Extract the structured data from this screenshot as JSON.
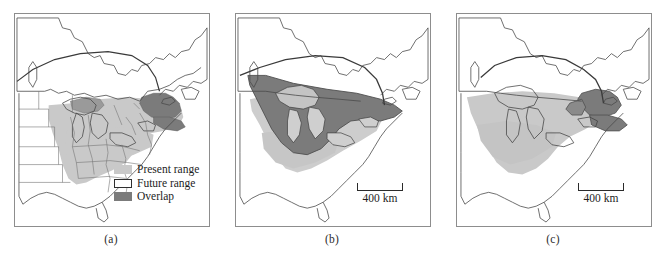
{
  "figure": {
    "type": "map-series",
    "panel_count": 3,
    "colors": {
      "present_range": "#c9c9c9",
      "future_range": "#ffffff",
      "overlap": "#7b7b7b",
      "coastline": "#4a4a4a",
      "state_border": "#6e6e6e",
      "range_boundary": "#3a3a3a",
      "frame": "#8d8d8d"
    }
  },
  "legend": {
    "items": [
      {
        "label": "Present range",
        "swatch": "light-gray-fill"
      },
      {
        "label": "Future range",
        "swatch": "white-fill-outline"
      },
      {
        "label": "Overlap",
        "swatch": "dark-gray-fill"
      }
    ]
  },
  "panels": [
    {
      "id": "a",
      "label": "(a)",
      "has_legend": true,
      "has_scalebar": false,
      "scalebar_text": "",
      "description": "Eastern North America with present range shaded light gray over the US Midwest, Mid-Atlantic and Southeast; overlap shaded dark gray in New England and southern Quebec."
    },
    {
      "id": "b",
      "label": "(b)",
      "has_legend": false,
      "has_scalebar": true,
      "scalebar_text": "400 km",
      "description": "Future range projection shown as a large dark gray overlap polygon covering the Great Lakes region and southern Ontario/Quebec, with light gray present range extending south."
    },
    {
      "id": "c",
      "label": "(c)",
      "has_legend": false,
      "has_scalebar": true,
      "scalebar_text": "400 km",
      "description": "Present range shaded light gray across the Midwest and Ohio Valley with a small dark gray overlap confined to New England and southern Quebec."
    }
  ]
}
